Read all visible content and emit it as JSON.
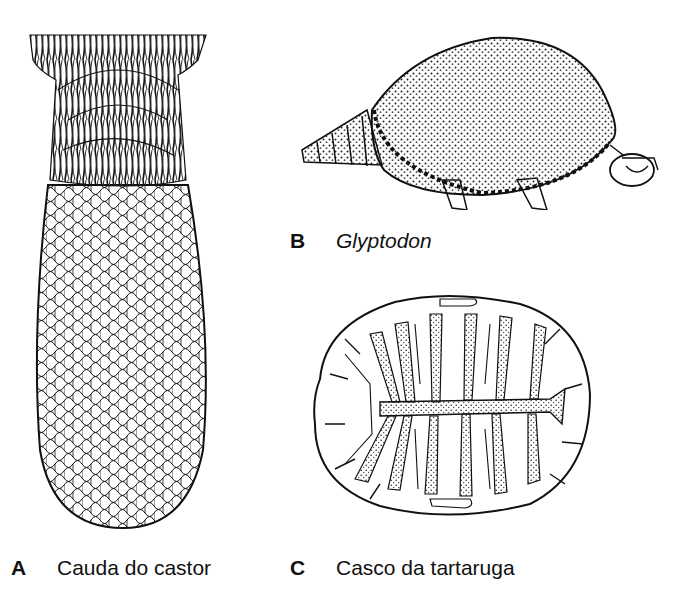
{
  "figure": {
    "panels": [
      {
        "letter": "A",
        "caption": "Cauda do castor",
        "italic": false,
        "subject": "beaver-tail"
      },
      {
        "letter": "B",
        "caption": "Glyptodon",
        "italic": true,
        "subject": "glyptodon"
      },
      {
        "letter": "C",
        "caption": "Casco da tartaruga",
        "italic": false,
        "subject": "turtle-shell"
      }
    ],
    "colors": {
      "ink": "#111111",
      "background": "#ffffff",
      "stipple": "#333333"
    }
  }
}
